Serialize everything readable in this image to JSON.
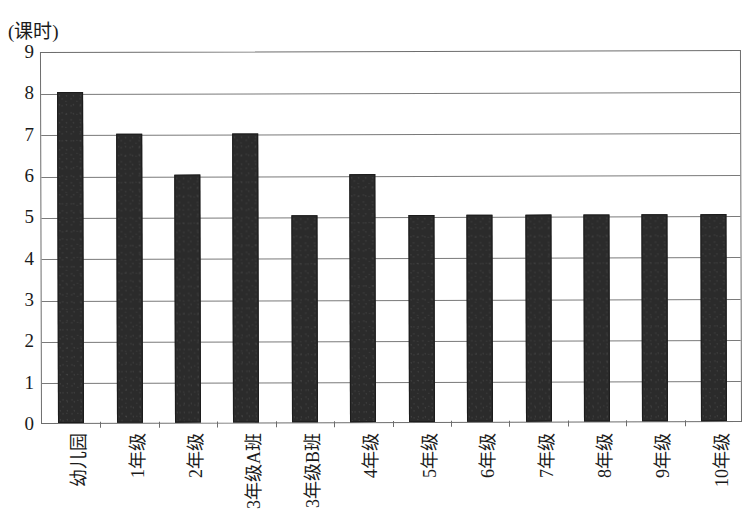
{
  "chart_data": {
    "type": "bar",
    "title": "",
    "subtitle": "",
    "xlabel": "",
    "ylabel": "(课时)",
    "y_unit_caption": "(课时)",
    "categories": [
      "幼儿园",
      "1年级",
      "2年级",
      "3年级A班",
      "3年级B班",
      "4年级",
      "5年级",
      "6年级",
      "7年级",
      "8年级",
      "9年级",
      "10年级"
    ],
    "values": [
      8,
      7,
      6,
      7,
      5,
      6,
      5,
      5,
      5,
      5,
      5,
      5
    ],
    "ylim": [
      0,
      9
    ],
    "y_ticks": [
      0,
      1,
      2,
      3,
      4,
      5,
      6,
      7,
      8,
      9
    ],
    "y_tick_labels": [
      "0",
      "1",
      "2",
      "3",
      "4",
      "5",
      "6",
      "7",
      "8",
      "9"
    ],
    "grid": true,
    "grid_axis": "y",
    "legend": false,
    "legend_position": "none",
    "bar_color": "#2b2b2b",
    "axis_color": "#6d6d6d",
    "background_color": "#ffffff",
    "x_tick_label_rotation": 90
  },
  "figure": {
    "caption": "",
    "frame_visible": true
  }
}
